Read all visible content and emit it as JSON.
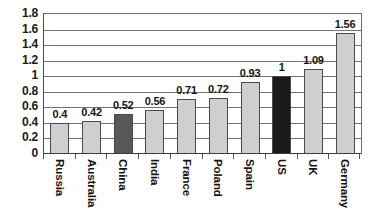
{
  "chart_data": {
    "type": "bar",
    "title": "",
    "subtitle": "",
    "xlabel": "",
    "ylabel": "",
    "categories": [
      "Russia",
      "Australia",
      "China",
      "India",
      "France",
      "Poland",
      "Spain",
      "US",
      "UK",
      "Germany"
    ],
    "values": [
      0.4,
      0.42,
      0.52,
      0.56,
      0.71,
      0.72,
      0.93,
      1,
      1.09,
      1.56
    ],
    "value_labels": [
      "0.4",
      "0.42",
      "0.52",
      "0.56",
      "0.71",
      "0.72",
      "0.93",
      "1",
      "1.09",
      "1.56"
    ],
    "bar_colors": [
      "#cfcfcf",
      "#cfcfcf",
      "#585858",
      "#cfcfcf",
      "#cfcfcf",
      "#cfcfcf",
      "#cfcfcf",
      "#1a1a1a",
      "#cfcfcf",
      "#cfcfcf"
    ],
    "highlighted": [
      "China",
      "US"
    ],
    "ylim": [
      0,
      1.8
    ],
    "ytick_labels": [
      "0",
      "0.2",
      "0.4",
      "0.6",
      "0.8",
      "1",
      "1.2",
      "1.4",
      "1.6",
      "1.8"
    ],
    "ytick_values": [
      0,
      0.2,
      0.4,
      0.6,
      0.8,
      1,
      1.2,
      1.4,
      1.6,
      1.8
    ],
    "grid": true,
    "grid_axis": "y",
    "legend": false,
    "legend_position": "none",
    "series": [
      {
        "name": "",
        "values": [
          0.4,
          0.42,
          0.52,
          0.56,
          0.71,
          0.72,
          0.93,
          1,
          1.09,
          1.56
        ]
      }
    ],
    "annotations": [],
    "colors": {
      "bar_default": "#cfcfcf",
      "bar_highlight_dark_gray": "#585858",
      "bar_highlight_black": "#1a1a1a",
      "bar_border": "#4a4a4a",
      "gridline": "#737373",
      "axis": "#3d3d3d",
      "text": "#141414",
      "background": "#ffffff"
    }
  }
}
